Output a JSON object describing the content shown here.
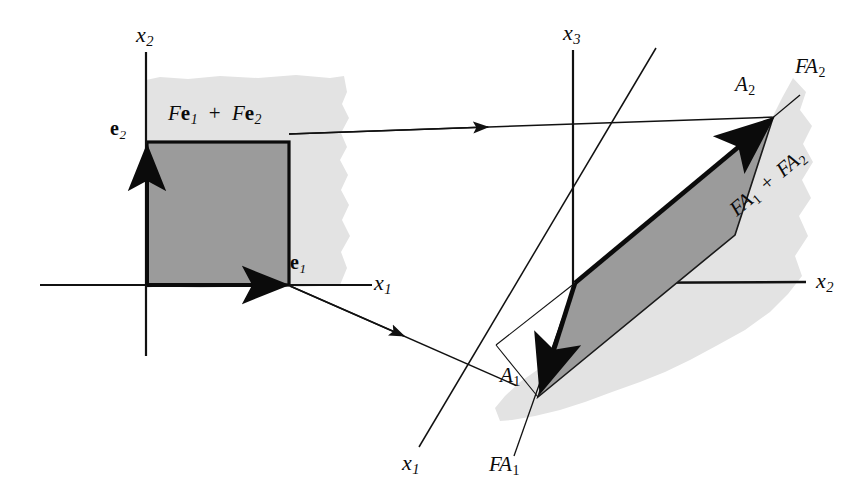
{
  "figure": {
    "type": "linear-algebra-diagram",
    "background_color": "#ffffff",
    "ink_color": "#0b0b0b",
    "light_shade_color": "#e2e2e2",
    "dark_shade_color": "#9a9a9a"
  },
  "left_panel": {
    "name": "domain-plane",
    "axes": [
      {
        "id": "x2-axis-left",
        "label": "x",
        "subscript": "2",
        "orientation": "vertical"
      },
      {
        "id": "x1-axis-left",
        "label": "x",
        "subscript": "1",
        "orientation": "horizontal"
      }
    ],
    "vectors": [
      {
        "id": "e1",
        "label": "e",
        "subscript": "1",
        "style": "bold-upright"
      },
      {
        "id": "e2",
        "label": "e",
        "subscript": "2",
        "style": "bold-upright"
      }
    ],
    "region_label": {
      "id": "fe1-plus-fe2",
      "parts": [
        "F",
        "e",
        "1",
        " + ",
        "F",
        "e",
        "2"
      ],
      "text": "Fe1 + Fe2"
    },
    "shapes": [
      {
        "id": "unit-square",
        "fill": "dark",
        "description": "unit square spanned by e1 and e2"
      },
      {
        "id": "domain-plane-patch",
        "fill": "light",
        "description": "ragged light gray plane patch behind square"
      }
    ]
  },
  "right_panel": {
    "name": "codomain-space",
    "axes": [
      {
        "id": "x3-axis",
        "label": "x",
        "subscript": "3",
        "orientation": "vertical"
      },
      {
        "id": "x2-axis-right",
        "label": "x",
        "subscript": "2",
        "orientation": "horizontal"
      },
      {
        "id": "x1-axis-right",
        "label": "x",
        "subscript": "1",
        "orientation": "diagonal-depth"
      }
    ],
    "vectors": [
      {
        "id": "A1",
        "label": "A",
        "subscript": "1",
        "style": "italic"
      },
      {
        "id": "A2",
        "label": "A",
        "subscript": "2",
        "style": "italic"
      }
    ],
    "edge_labels": [
      {
        "id": "FA1",
        "label": "FA",
        "subscript": "1",
        "style": "italic"
      },
      {
        "id": "FA2",
        "label": "FA",
        "subscript": "2",
        "style": "italic"
      }
    ],
    "region_label": {
      "id": "fa1-plus-fa2",
      "parts": [
        "FA",
        "1",
        " + ",
        "FA",
        "2"
      ],
      "text": "FA1 + FA2",
      "rotation_deg": -40
    },
    "shapes": [
      {
        "id": "image-parallelogram",
        "fill": "dark",
        "description": "parallelogram spanned by A1 and A2"
      },
      {
        "id": "codomain-plane-patch",
        "fill": "light",
        "description": "ragged light gray plane patch behind parallelogram"
      }
    ]
  },
  "mapping_arrows": [
    {
      "id": "map-arrow-upper",
      "from": "e2-corner-region",
      "to": "A2-tip",
      "description": "thin arrow from unit square top-right toward A2"
    },
    {
      "id": "map-arrow-lower",
      "from": "e1-tip",
      "to": "A1-tip",
      "description": "thin arrow from e1 toward A1"
    }
  ],
  "labels": {
    "x1_left": {
      "base": "x",
      "sub": "1"
    },
    "x2_left": {
      "base": "x",
      "sub": "2"
    },
    "x1_right": {
      "base": "x",
      "sub": "1"
    },
    "x2_right": {
      "base": "x",
      "sub": "2"
    },
    "x3_right": {
      "base": "x",
      "sub": "3"
    },
    "e1": {
      "base": "e",
      "sub": "1"
    },
    "e2": {
      "base": "e",
      "sub": "2"
    },
    "A1": {
      "base": "A",
      "sub": "1"
    },
    "A2": {
      "base": "A",
      "sub": "2"
    },
    "FA1": {
      "base": "FA",
      "sub": "1"
    },
    "FA2": {
      "base": "FA",
      "sub": "2"
    },
    "Fe_sum": {
      "f1": "F",
      "e1": "e",
      "s1": "1",
      "plus": "+",
      "f2": "F",
      "e2": "e",
      "s2": "2"
    },
    "FA_sum": {
      "fa1": "FA",
      "s1": "1",
      "plus": "+",
      "fa2": "FA",
      "s2": "2"
    }
  }
}
